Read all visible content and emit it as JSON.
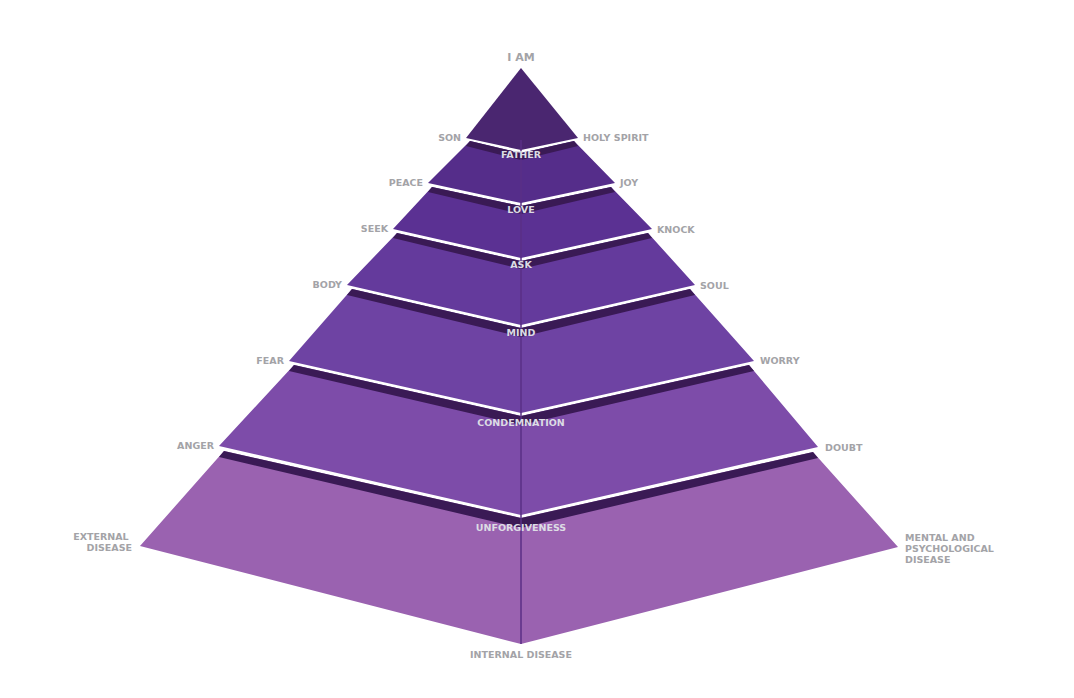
{
  "diagram": {
    "type": "layered-pyramid",
    "apex_label": "I AM",
    "bottom_label": "INTERNAL DISEASE",
    "colors": {
      "band": "#3a1a55",
      "center_line": "#5a2f86",
      "side_label": "#a3a3a7",
      "center_label": "#dcdce4"
    },
    "tiers": [
      {
        "center_label": "",
        "left_label": "SON",
        "right_label": "HOLY SPIRIT",
        "color": "#4a2670"
      },
      {
        "center_label": "FATHER",
        "left_label": "PEACE",
        "right_label": "JOY",
        "color": "#552d8a"
      },
      {
        "center_label": "LOVE",
        "left_label": "SEEK",
        "right_label": "KNOCK",
        "color": "#5b3193"
      },
      {
        "center_label": "ASK",
        "left_label": "BODY",
        "right_label": "SOUL",
        "color": "#643a9c"
      },
      {
        "center_label": "MIND",
        "left_label": "FEAR",
        "right_label": "WORRY",
        "color": "#6e43a3"
      },
      {
        "center_label": "CONDEMNATION",
        "left_label": "ANGER",
        "right_label": "DOUBT",
        "color": "#7d4ca9"
      },
      {
        "center_label": "UNFORGIVENESS",
        "left_label": "EXTERNAL DISEASE",
        "right_label": "MENTAL AND PSYCHOLOGICAL DISEASE",
        "color": "#9a62b0"
      }
    ],
    "multiline_labels": {
      "external": [
        "EXTERNAL",
        "DISEASE"
      ],
      "mental": [
        "MENTAL AND",
        "PSYCHOLOGICAL",
        "DISEASE"
      ]
    }
  }
}
